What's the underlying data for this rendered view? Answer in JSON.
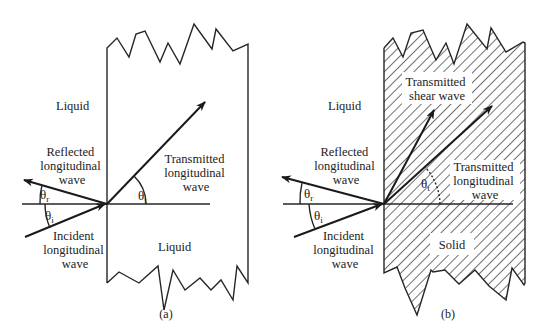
{
  "figure": {
    "panel_a": {
      "caption": "(a)",
      "media_left": "Liquid",
      "media_right": "Liquid",
      "reflected": [
        "Reflected",
        "longitudinal",
        "wave"
      ],
      "incident": [
        "Incident",
        "longitudinal",
        "wave"
      ],
      "transmitted_longitudinal": [
        "Transmitted",
        "longitudinal",
        "wave"
      ],
      "angle_reflected": {
        "symbol": "θ",
        "sub": "r"
      },
      "angle_incident": {
        "symbol": "θ",
        "sub": "i"
      },
      "angle_transmitted": {
        "symbol": "θ",
        "sub": "t"
      }
    },
    "panel_b": {
      "caption": "(b)",
      "media_left": "Liquid",
      "media_right": "Solid",
      "reflected": [
        "Reflected",
        "longitudinal",
        "wave"
      ],
      "incident": [
        "Incident",
        "longitudinal",
        "wave"
      ],
      "transmitted_longitudinal": [
        "Transmitted",
        "longitudinal",
        "wave"
      ],
      "transmitted_shear": [
        "Transmitted",
        "shear wave"
      ],
      "angle_reflected": {
        "symbol": "θ",
        "sub": "r"
      },
      "angle_incident": {
        "symbol": "θ",
        "sub": "i"
      },
      "angle_transmitted": {
        "symbol": "θ",
        "sub": "t"
      }
    }
  }
}
